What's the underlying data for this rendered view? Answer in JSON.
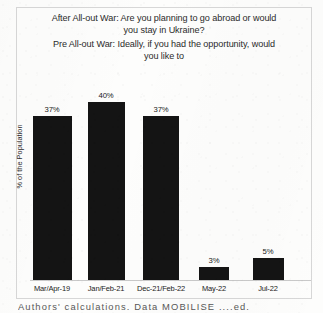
{
  "chart_data": {
    "type": "bar",
    "title": "After All-out War: Are you planning to go abroad or would you stay in Ukraine? Pre All-out War: Ideally, if you had the opportunity, would you like to",
    "title_lines": [
      "After All-out War: Are you planning to go abroad or would\nyou stay in Ukraine?",
      "Pre All-out War: Ideally, if you had the opportunity, would\nyou like to"
    ],
    "xlabel": "",
    "ylabel": "% of the Population",
    "ylim": [
      0,
      45
    ],
    "grid": false,
    "legend": "none",
    "bar_color": "#141414",
    "categories": [
      "Mar/Apr-19",
      "Jan/Feb-21",
      "Dec-21/Feb-22",
      "May-22",
      "Jul-22"
    ],
    "values": [
      37,
      40,
      37,
      3,
      5
    ],
    "value_labels": [
      "37%",
      "40%",
      "37%",
      "3%",
      "5%"
    ]
  },
  "figure": {
    "title_after_war": "After All-out War: Are you planning to go abroad or would\nyou stay in Ukraine?",
    "title_pre_war": "Pre All-out War: Ideally, if you had the opportunity, would\nyou like to",
    "y_axis_label": "% of the Population",
    "footer_note": "Authors' calculations. Data        MOBILISE         ....ed."
  }
}
